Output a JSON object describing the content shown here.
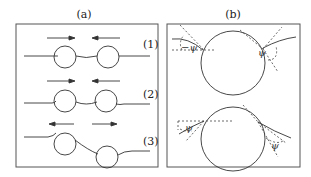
{
  "figure": {
    "panels": [
      {
        "id": "a",
        "label": "(a)",
        "rows": [
          {
            "label": "(1)",
            "arrows": "inward",
            "description": "two spheres on string, arrows pointing toward each other"
          },
          {
            "label": "(2)",
            "arrows": "inward",
            "description": "two spheres on string, level"
          },
          {
            "label": "(3)",
            "arrows": "outward",
            "description": "two spheres on string, offset vertically, arrows pointing apart"
          }
        ]
      },
      {
        "id": "b",
        "label": "(b)",
        "angle_symbol": "ψ",
        "top": {
          "left_angle": "−ψ",
          "right_angle": "ψ"
        },
        "bottom": {
          "left_angle": "ψ",
          "right_angle": "ψ"
        }
      }
    ],
    "colors": {
      "stroke": "#333333",
      "frame": "#555555",
      "background": "#ffffff"
    }
  }
}
